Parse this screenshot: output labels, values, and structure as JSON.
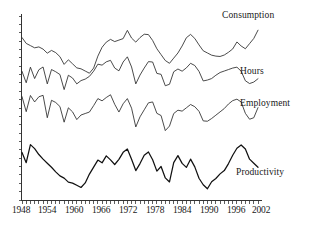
{
  "chart_data": {
    "type": "line",
    "title": "",
    "subtitle": "",
    "xlabel": "",
    "ylabel": "",
    "grid": false,
    "legend_position": "right-inline",
    "xlim": [
      1948,
      2004
    ],
    "ylim": [
      0,
      100
    ],
    "xticks": [
      1948,
      1954,
      1960,
      1966,
      1972,
      1978,
      1984,
      1990,
      1996,
      2002
    ],
    "xtick_labels": [
      "1948",
      "1954",
      "1960",
      "1966",
      "1972",
      "1978",
      "1984",
      "1990",
      "1996",
      "2002"
    ],
    "ytick_labels": [],
    "series": [
      {
        "name": "Consumption",
        "label": "Consumption",
        "color": "#2a2a2a",
        "x": [
          1948,
          1949,
          1950,
          1951,
          1952,
          1953,
          1954,
          1955,
          1956,
          1957,
          1958,
          1959,
          1960,
          1961,
          1962,
          1963,
          1964,
          1965,
          1966,
          1967,
          1968,
          1969,
          1970,
          1971,
          1972,
          1973,
          1974,
          1975,
          1976,
          1977,
          1978,
          1979,
          1980,
          1981,
          1982,
          1983,
          1984,
          1985,
          1986,
          1987,
          1988,
          1989,
          1990,
          1991,
          1992,
          1993,
          1994,
          1995,
          1996,
          1997,
          1998,
          1999,
          2000,
          2001,
          2002,
          2003,
          2004
        ],
        "values": [
          88,
          85,
          84,
          83,
          83,
          82,
          80,
          81,
          80,
          78,
          74,
          76,
          74,
          72,
          71,
          70,
          69,
          72,
          78,
          83,
          86,
          87,
          86,
          87,
          88,
          92,
          88,
          86,
          88,
          90,
          90,
          87,
          82,
          79,
          76,
          74,
          77,
          80,
          84,
          88,
          90,
          88,
          84,
          81,
          80,
          79,
          78,
          78,
          79,
          80,
          82,
          86,
          84,
          82,
          85,
          88,
          92
        ]
      },
      {
        "name": "Hours",
        "label": "Hours",
        "color": "#2a2a2a",
        "x": [
          1948,
          1949,
          1950,
          1951,
          1952,
          1953,
          1954,
          1955,
          1956,
          1957,
          1958,
          1959,
          1960,
          1961,
          1962,
          1963,
          1964,
          1965,
          1966,
          1967,
          1968,
          1969,
          1970,
          1971,
          1972,
          1973,
          1974,
          1975,
          1976,
          1977,
          1978,
          1979,
          1980,
          1981,
          1982,
          1983,
          1984,
          1985,
          1986,
          1987,
          1988,
          1989,
          1990,
          1991,
          1992,
          1993,
          1994,
          1995,
          1996,
          1997,
          1998,
          1999,
          2000,
          2001,
          2002,
          2003,
          2004
        ],
        "values": [
          70,
          64,
          72,
          66,
          71,
          72,
          63,
          71,
          70,
          68,
          60,
          68,
          66,
          63,
          65,
          66,
          67,
          70,
          74,
          73,
          75,
          76,
          72,
          70,
          75,
          78,
          72,
          63,
          68,
          72,
          75,
          75,
          69,
          68,
          62,
          63,
          70,
          71,
          70,
          72,
          74,
          73,
          70,
          65,
          65,
          66,
          68,
          69,
          70,
          71,
          72,
          72,
          70,
          65,
          63,
          64,
          66
        ]
      },
      {
        "name": "Employment",
        "label": "Employment",
        "color": "#2a2a2a",
        "x": [
          1948,
          1949,
          1950,
          1951,
          1952,
          1953,
          1954,
          1955,
          1956,
          1957,
          1958,
          1959,
          1960,
          1961,
          1962,
          1963,
          1964,
          1965,
          1966,
          1967,
          1968,
          1969,
          1970,
          1971,
          1972,
          1973,
          1974,
          1975,
          1976,
          1977,
          1978,
          1979,
          1980,
          1981,
          1982,
          1983,
          1984,
          1985,
          1986,
          1987,
          1988,
          1989,
          1990,
          1991,
          1992,
          1993,
          1994,
          1995,
          1996,
          1997,
          1998,
          1999,
          2000,
          2001,
          2002,
          2003,
          2004
        ],
        "values": [
          56,
          48,
          57,
          53,
          56,
          57,
          45,
          54,
          53,
          51,
          42,
          50,
          48,
          44,
          46,
          47,
          48,
          51,
          55,
          54,
          56,
          57,
          52,
          48,
          52,
          55,
          50,
          40,
          45,
          49,
          53,
          53,
          47,
          46,
          38,
          40,
          47,
          49,
          48,
          50,
          52,
          51,
          48,
          43,
          43,
          44,
          46,
          48,
          50,
          52,
          54,
          55,
          53,
          47,
          44,
          45,
          50
        ]
      },
      {
        "name": "Productivity",
        "label": "Productivity",
        "color": "#111111",
        "x": [
          1948,
          1949,
          1950,
          1951,
          1952,
          1953,
          1954,
          1955,
          1956,
          1957,
          1958,
          1959,
          1960,
          1961,
          1962,
          1963,
          1964,
          1965,
          1966,
          1967,
          1968,
          1969,
          1970,
          1971,
          1972,
          1973,
          1974,
          1975,
          1976,
          1977,
          1978,
          1979,
          1980,
          1981,
          1982,
          1983,
          1984,
          1985,
          1986,
          1987,
          1988,
          1989,
          1990,
          1991,
          1992,
          1993,
          1994,
          1995,
          1996,
          1997,
          1998,
          1999,
          2000,
          2001,
          2002,
          2003,
          2004
        ],
        "values": [
          26,
          20,
          30,
          28,
          25,
          22,
          20,
          18,
          15,
          13,
          12,
          10,
          9,
          8,
          7,
          9,
          14,
          18,
          22,
          20,
          24,
          22,
          19,
          22,
          26,
          28,
          22,
          16,
          20,
          24,
          26,
          22,
          16,
          18,
          12,
          10,
          20,
          24,
          20,
          18,
          22,
          18,
          12,
          8,
          6,
          10,
          12,
          14,
          16,
          20,
          24,
          28,
          30,
          28,
          22,
          20,
          18
        ]
      }
    ]
  },
  "labels": {
    "consumption": "Consumption",
    "hours": "Hours",
    "employment": "Employment",
    "productivity": "Productivity"
  },
  "xaxis": {
    "ticks": [
      {
        "label": "1948",
        "left": 12
      },
      {
        "label": "1954",
        "left": 38
      },
      {
        "label": "1960",
        "left": 65
      },
      {
        "label": "1966",
        "left": 92
      },
      {
        "label": "1972",
        "left": 119
      },
      {
        "label": "1978",
        "left": 146
      },
      {
        "label": "1984",
        "left": 173
      },
      {
        "label": "1990",
        "left": 200
      },
      {
        "label": "1996",
        "left": 227
      },
      {
        "label": "2002",
        "left": 252
      }
    ]
  }
}
